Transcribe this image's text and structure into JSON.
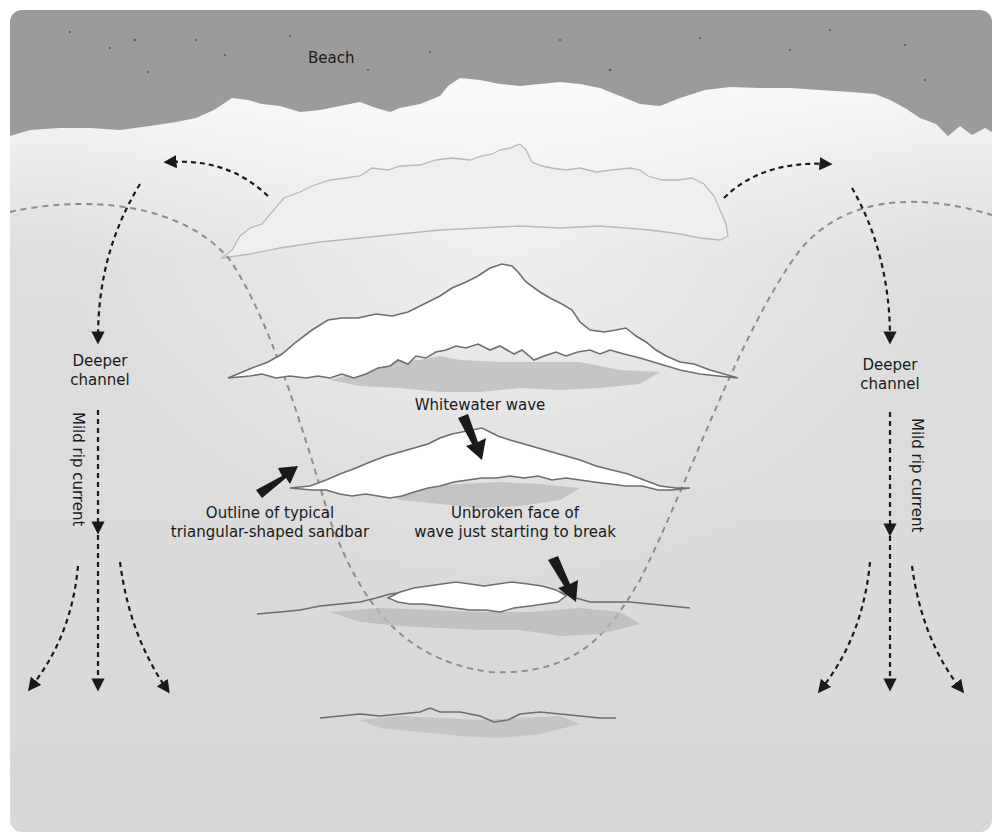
{
  "diagram": {
    "colors": {
      "beach": "#9b9b9b",
      "foam": "#ffffff",
      "water": "#dcdcdc",
      "wave_outline": "#6e6e6e",
      "wave_shadow": "#b5b5b5",
      "sandbar_outline": "#8a8a8a",
      "arrow": "#1a1a1a"
    },
    "labels": {
      "beach": "Beach",
      "left_channel_line1": "Deeper",
      "left_channel_line2": "channel",
      "right_channel_line1": "Deeper",
      "right_channel_line2": "channel",
      "left_rip": "Mild rip current",
      "right_rip": "Mild rip current",
      "whitewater": "Whitewater wave",
      "sandbar_line1": "Outline of typical",
      "sandbar_line2": "triangular-shaped sandbar",
      "unbroken_line1": "Unbroken face of",
      "unbroken_line2": "wave just starting to break"
    }
  }
}
